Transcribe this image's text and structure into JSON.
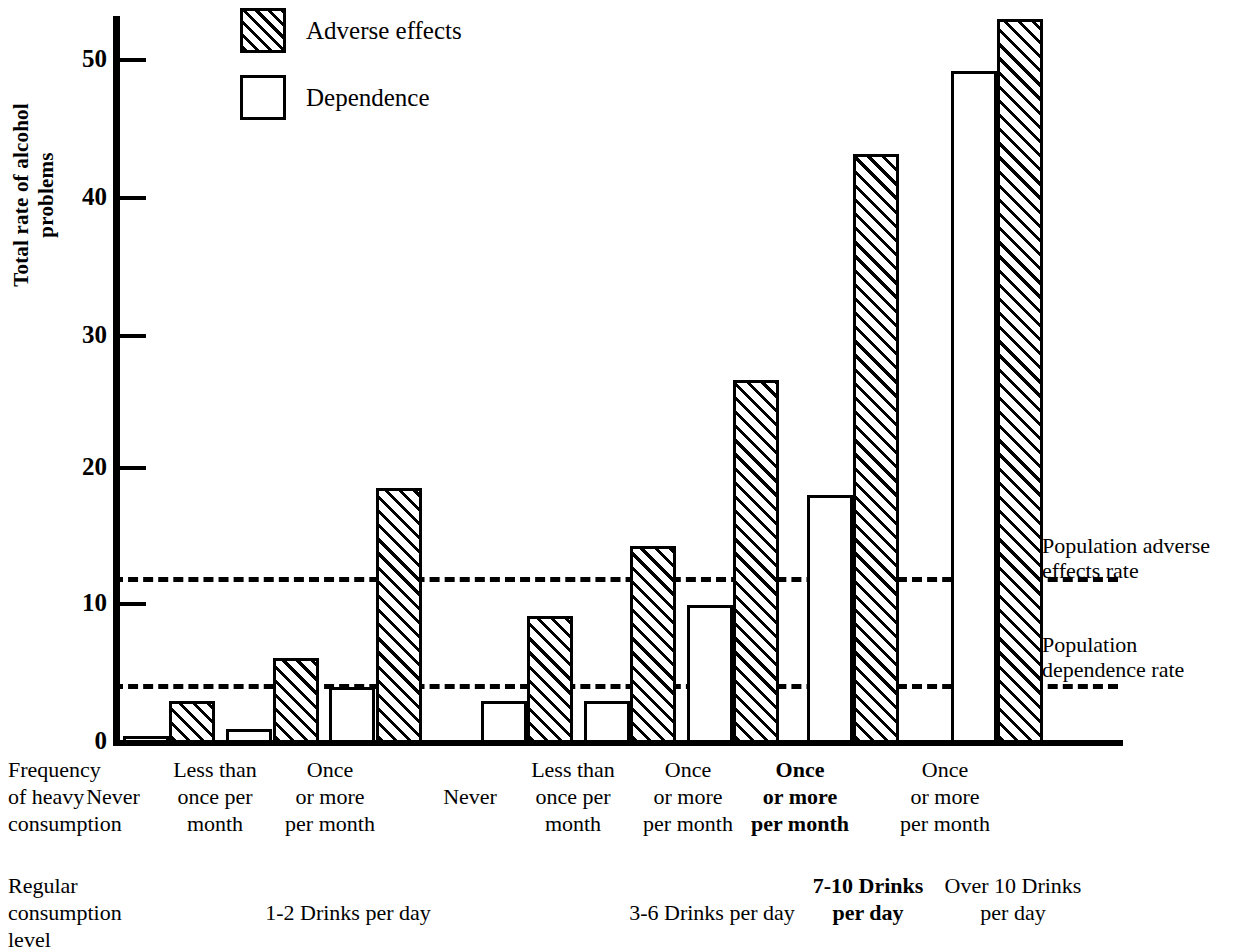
{
  "chart_data": {
    "type": "bar",
    "title": "",
    "xlabel": "",
    "ylabel": "Total rate of alcohol problems",
    "ylim": [
      0,
      52
    ],
    "yticks": [
      0,
      10,
      20,
      30,
      40,
      50
    ],
    "grid": false,
    "legend_position": "top-left",
    "series": [
      {
        "name": "Dependence",
        "fill": "white",
        "values": [
          0.5,
          1.0,
          4.0,
          3.0,
          3.0,
          9.8,
          17.6,
          47.7
        ]
      },
      {
        "name": "Adverse effects",
        "fill": "hatched",
        "values": [
          3.0,
          6.0,
          18.1,
          9.0,
          14.0,
          25.8,
          41.8,
          51.4
        ]
      }
    ],
    "categories": [
      "Never",
      "Less than once per month",
      "Once or more per month",
      "Never",
      "Less than once per month",
      "Once or more per month",
      "Once or more per month",
      "Once or more per month"
    ],
    "reference_lines": [
      {
        "name": "Population adverse effects rate",
        "value": 11.8,
        "style": "dashed"
      },
      {
        "name": "Population dependence rate",
        "value": 4.2,
        "style": "dashed"
      }
    ],
    "groups": [
      {
        "label": "1-2 Drinks per day",
        "bold": false,
        "bars": 3
      },
      {
        "label": "3-6 Drinks per day",
        "bold": false,
        "bars": 3
      },
      {
        "label": "7-10 Drinks per day",
        "bold": true,
        "bars": 1
      },
      {
        "label": "Over 10 Drinks per day",
        "bold": false,
        "bars": 1
      }
    ]
  },
  "legend": {
    "items": [
      {
        "label": "Adverse effects",
        "swatch": "hatched"
      },
      {
        "label": "Dependence",
        "swatch": "white"
      }
    ]
  },
  "axis": {
    "y_title": "Total rate of alcohol problems",
    "ticks": [
      "50",
      "40",
      "30",
      "20",
      "10",
      "0"
    ]
  },
  "annotations": {
    "adverse_line_label_1": "Population adverse",
    "adverse_line_label_2": "effects rate",
    "dependence_line_label_1": "Population",
    "dependence_line_label_2": "dependence rate"
  },
  "xaxis": {
    "row1_head_1": "Frequency",
    "row1_head_2": "of heavy",
    "row1_head_3": "consumption",
    "row2_head_1": "Regular",
    "row2_head_2": "consumption",
    "row2_head_3": "level",
    "freq": [
      {
        "l1": "",
        "l2": "Never",
        "l3": "",
        "bold": false
      },
      {
        "l1": "Less than",
        "l2": "once per",
        "l3": "month",
        "bold": false
      },
      {
        "l1": "Once",
        "l2": "or more",
        "l3": "per month",
        "bold": false
      },
      {
        "l1": "",
        "l2": "Never",
        "l3": "",
        "bold": false
      },
      {
        "l1": "Less than",
        "l2": "once per",
        "l3": "month",
        "bold": false
      },
      {
        "l1": "Once",
        "l2": "or more",
        "l3": "per month",
        "bold": false
      },
      {
        "l1": "Once",
        "l2": "or more",
        "l3": "per month",
        "bold": true
      },
      {
        "l1": "Once",
        "l2": "or more",
        "l3": "per month",
        "bold": false
      }
    ],
    "levels": [
      {
        "l1": "1-2 Drinks per day",
        "l2": "",
        "bold": false
      },
      {
        "l1": "3-6 Drinks per day",
        "l2": "",
        "bold": false
      },
      {
        "l1": "7-10 Drinks",
        "l2": "per day",
        "bold": true
      },
      {
        "l1": "Over 10 Drinks",
        "l2": "per day",
        "bold": false
      }
    ]
  }
}
